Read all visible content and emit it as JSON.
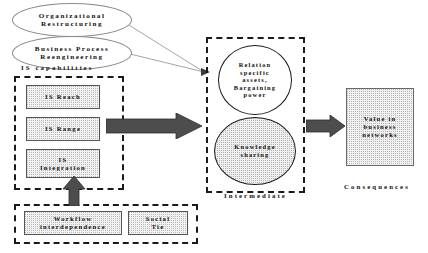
{
  "diagram": {
    "antecedent_ellipses": [
      {
        "id": "organizational-restructuring",
        "label": "Organizational\nRestructuring"
      },
      {
        "id": "business-process-reengineering",
        "label": "Business Process\nReengineering"
      }
    ],
    "groups": {
      "is_capabilities": {
        "caption": "IS capabilities",
        "items": [
          {
            "id": "is-reach",
            "label": "IS Reach"
          },
          {
            "id": "is-range",
            "label": "IS Range"
          },
          {
            "id": "is-integration",
            "label": "IS\nIntegration"
          }
        ]
      },
      "antecedents_bottom": {
        "caption": "",
        "items": [
          {
            "id": "workflow-interdependence",
            "label": "Workflow\ninterdependence"
          },
          {
            "id": "social-tie",
            "label": "Social\nTie"
          }
        ]
      },
      "intermediate": {
        "caption": "Intermediate",
        "items": [
          {
            "id": "relation-specific-assets",
            "label": "Relation\nspecific\nassets,\nBargaining\npower"
          },
          {
            "id": "knowledge-sharing",
            "label": "Knowledge\nsharing"
          }
        ]
      },
      "consequences": {
        "caption": "Consequences",
        "items": [
          {
            "id": "value-in-business-networks",
            "label": "Value in\nbusiness\nnetworks"
          }
        ]
      }
    },
    "connectors": [
      {
        "id": "is-capabilities-to-intermediate",
        "kind": "block-arrow",
        "direction": "right"
      },
      {
        "id": "intermediate-to-consequences",
        "kind": "block-arrow",
        "direction": "right"
      },
      {
        "id": "bottom-antecedents-to-is-capabilities",
        "kind": "block-arrow",
        "direction": "up"
      },
      {
        "id": "organizational-restructuring-to-intermediate",
        "kind": "line-arrow",
        "direction": "right"
      },
      {
        "id": "business-process-reengineering-to-intermediate",
        "kind": "line-arrow",
        "direction": "right"
      }
    ],
    "colors": {
      "arrow_fill": "#4d4d4d",
      "arrow_stroke": "#2b2b2b",
      "dashed_border": "#1a1a1a",
      "ellipse_border": "#8a8a8a",
      "text": "#101010",
      "dot_fill": "#f1f1f1",
      "background": "#ffffff"
    }
  }
}
